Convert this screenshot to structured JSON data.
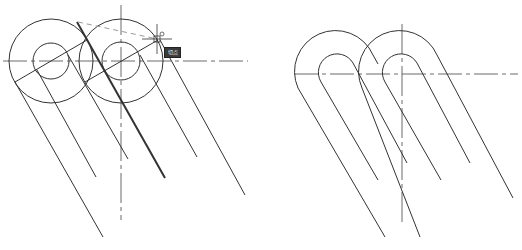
{
  "figure": {
    "left_panel": {
      "description": "Construction view: two pairs of concentric circles with tangent lines being drawn",
      "circles": [
        {
          "cx": 51,
          "cy": 61,
          "r_outer": 42,
          "r_inner": 18
        },
        {
          "cx": 121,
          "cy": 61,
          "r_outer": 42,
          "r_inner": 19
        }
      ],
      "snap_tooltip": "切点",
      "cursor": {
        "x": 157,
        "y": 39
      }
    },
    "right_panel": {
      "description": "Finished view: trimmed arcs joined with parallel tangent lines",
      "arcs": [
        {
          "cx": 338,
          "cy": 74,
          "r_outer": 40,
          "r_inner": 18
        },
        {
          "cx": 402,
          "cy": 74,
          "r_outer": 40,
          "r_inner": 18
        }
      ]
    },
    "colors": {
      "line": "#333333",
      "centerline": "#444444",
      "tracking": "#9a9a9a",
      "background": "#ffffff"
    }
  }
}
